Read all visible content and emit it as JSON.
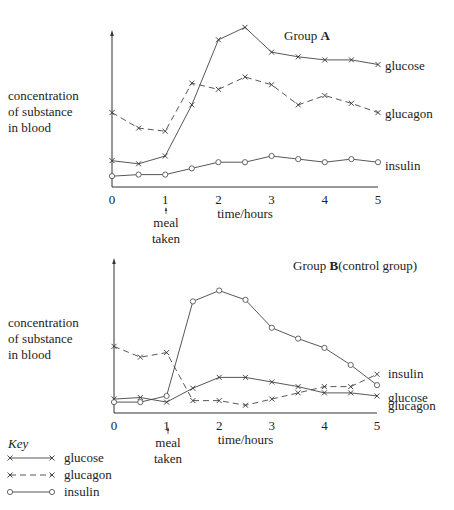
{
  "chart_data": [
    {
      "type": "line",
      "title": "Group A",
      "title_prefix": "Group ",
      "title_bold": "A",
      "title_suffix": "",
      "xlabel": "time/hours",
      "ylabel": [
        "concentration",
        "of substance",
        "in blood"
      ],
      "x": [
        0,
        0.5,
        1,
        1.5,
        2,
        2.5,
        3,
        3.5,
        4,
        4.5,
        5
      ],
      "x_ticks": [
        "0",
        "1",
        "2",
        "3",
        "4",
        "5"
      ],
      "ylim": [
        0,
        10
      ],
      "grid": false,
      "annotation": {
        "x": 1,
        "text": [
          "meal",
          "taken"
        ]
      },
      "series": [
        {
          "name": "glucose",
          "style": "solid",
          "marker": "x",
          "values": [
            1.7,
            1.5,
            2.0,
            5.3,
            9.5,
            10.3,
            8.7,
            8.4,
            8.2,
            8.2,
            7.9
          ]
        },
        {
          "name": "glucagon",
          "style": "dashed",
          "marker": "x",
          "values": [
            4.8,
            3.8,
            3.6,
            6.7,
            6.3,
            7.1,
            6.6,
            5.3,
            5.9,
            5.4,
            4.8
          ]
        },
        {
          "name": "insulin",
          "style": "solid",
          "marker": "o",
          "values": [
            0.7,
            0.8,
            0.8,
            1.2,
            1.6,
            1.6,
            2.0,
            1.8,
            1.6,
            1.8,
            1.6
          ]
        }
      ]
    },
    {
      "type": "line",
      "title": "Group B (control group)",
      "title_prefix": "Group ",
      "title_bold": "B",
      "title_suffix": "(control group)",
      "xlabel": "time/hours",
      "ylabel": [
        "concentration",
        "of substance",
        "in blood"
      ],
      "x": [
        0,
        0.5,
        1,
        1.5,
        2,
        2.5,
        3,
        3.5,
        4,
        4.5,
        5
      ],
      "x_ticks": [
        "0",
        "1",
        "2",
        "3",
        "4",
        "5"
      ],
      "ylim": [
        0,
        10
      ],
      "grid": false,
      "annotation": {
        "x": 1,
        "text": [
          "meal",
          "taken"
        ]
      },
      "series": [
        {
          "name": "glucose",
          "style": "solid",
          "marker": "x",
          "values": [
            0.9,
            1.0,
            0.7,
            1.6,
            2.3,
            2.3,
            2.0,
            1.7,
            1.3,
            1.3,
            1.1
          ]
        },
        {
          "name": "glucagon",
          "style": "dashed",
          "marker": "x",
          "values": [
            4.3,
            3.6,
            3.9,
            0.8,
            0.8,
            0.5,
            0.9,
            1.3,
            1.7,
            1.7,
            2.5
          ]
        },
        {
          "name": "insulin",
          "style": "solid",
          "marker": "o",
          "values": [
            0.7,
            0.7,
            1.1,
            7.2,
            7.9,
            7.3,
            5.5,
            4.8,
            4.2,
            3.1,
            1.8
          ]
        }
      ]
    }
  ],
  "key": {
    "title": "Key",
    "items": [
      {
        "name": "glucose",
        "style": "solid",
        "marker": "x"
      },
      {
        "name": "glucagon",
        "style": "dashed",
        "marker": "x"
      },
      {
        "name": "insulin",
        "style": "solid",
        "marker": "o"
      }
    ]
  }
}
